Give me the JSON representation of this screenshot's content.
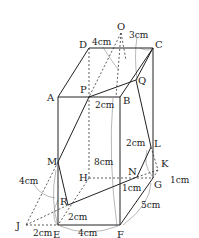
{
  "diagram": {
    "type": "geometry",
    "points": {
      "O": "O",
      "D": "D",
      "C": "C",
      "A": "A",
      "P": "P",
      "B": "B",
      "Q": "Q",
      "L": "L",
      "K": "K",
      "N": "N",
      "H": "H",
      "G": "G",
      "M": "M",
      "R": "R",
      "J": "J",
      "E": "E",
      "F": "F"
    },
    "dimensions": {
      "DO": "4cm",
      "OC": "3cm",
      "PB": "2cm",
      "BF": "8cm",
      "LG": "2cm",
      "NG": "1cm",
      "GK": "1cm",
      "FG": "5cm",
      "EM": "4cm",
      "ER": "2cm",
      "JE": "2cm",
      "EF": "4cm"
    }
  }
}
